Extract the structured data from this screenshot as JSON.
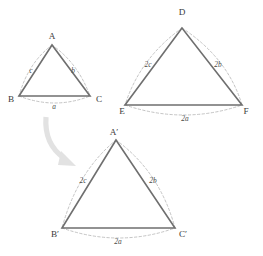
{
  "figure": {
    "colors": {
      "triangle_stroke": "#6f6f6f",
      "arc_stroke": "#b9b9b9",
      "arrow_fill": "#e2e2e2",
      "label_text": "#3a3a3a",
      "background": "#ffffff"
    },
    "triangles": [
      {
        "id": "original",
        "name": "triangle-abc",
        "vertices": [
          {
            "name": "A",
            "label": "A"
          },
          {
            "name": "B",
            "label": "B"
          },
          {
            "name": "C",
            "label": "C"
          }
        ],
        "sides": [
          {
            "name": "c",
            "label": "c"
          },
          {
            "name": "b",
            "label": "b"
          },
          {
            "name": "a",
            "label": "a"
          }
        ]
      },
      {
        "id": "scaled-def",
        "name": "triangle-def",
        "vertices": [
          {
            "name": "D",
            "label": "D"
          },
          {
            "name": "E",
            "label": "E"
          },
          {
            "name": "F",
            "label": "F"
          }
        ],
        "sides": [
          {
            "name": "2c",
            "label": "2c"
          },
          {
            "name": "2b",
            "label": "2b"
          },
          {
            "name": "2a",
            "label": "2a"
          }
        ]
      },
      {
        "id": "scaled-aprime",
        "name": "triangle-a-prime-b-prime-c-prime",
        "vertices": [
          {
            "name": "A'",
            "label": "A′"
          },
          {
            "name": "B'",
            "label": "B′"
          },
          {
            "name": "C'",
            "label": "C′"
          }
        ],
        "sides": [
          {
            "name": "2c",
            "label": "2c"
          },
          {
            "name": "2b",
            "label": "2b"
          },
          {
            "name": "2a",
            "label": "2a"
          }
        ]
      }
    ],
    "arrow": {
      "name": "transformation-arrow",
      "direction": "down-right"
    }
  }
}
